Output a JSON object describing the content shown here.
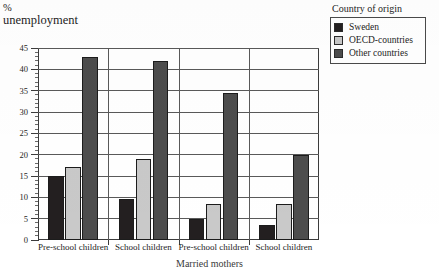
{
  "axis_title": {
    "unit": "%",
    "label": "unemployment"
  },
  "legend": {
    "title": "Country of origin",
    "entries": [
      {
        "label": "Sweden",
        "color": "#231f20"
      },
      {
        "label": "OECD-countries",
        "color": "#c9c9c9"
      },
      {
        "label": "Other countries",
        "color": "#4d4d4d"
      }
    ]
  },
  "bottom_caption": "Married mothers",
  "chart_data": {
    "type": "bar",
    "title": "% unemployment",
    "xlabel": "",
    "ylabel": "% unemployment",
    "ylim": [
      0,
      45
    ],
    "ytick_step": 5,
    "yticks": [
      "0",
      "5",
      "10",
      "15",
      "20",
      "25",
      "30",
      "35",
      "40",
      "45"
    ],
    "grid": true,
    "legend_position": "top-right",
    "categories": [
      "Pre-school children",
      "School children",
      "Pre-school children",
      "School children"
    ],
    "series": [
      {
        "name": "Sweden",
        "color": "#231f20",
        "values": [
          15,
          9.5,
          5,
          3.5
        ]
      },
      {
        "name": "OECD-countries",
        "color": "#c9c9c9",
        "values": [
          17,
          19,
          8.5,
          8.5
        ]
      },
      {
        "name": "Other countries",
        "color": "#4d4d4d",
        "values": [
          43,
          42,
          34.5,
          20
        ]
      }
    ]
  }
}
